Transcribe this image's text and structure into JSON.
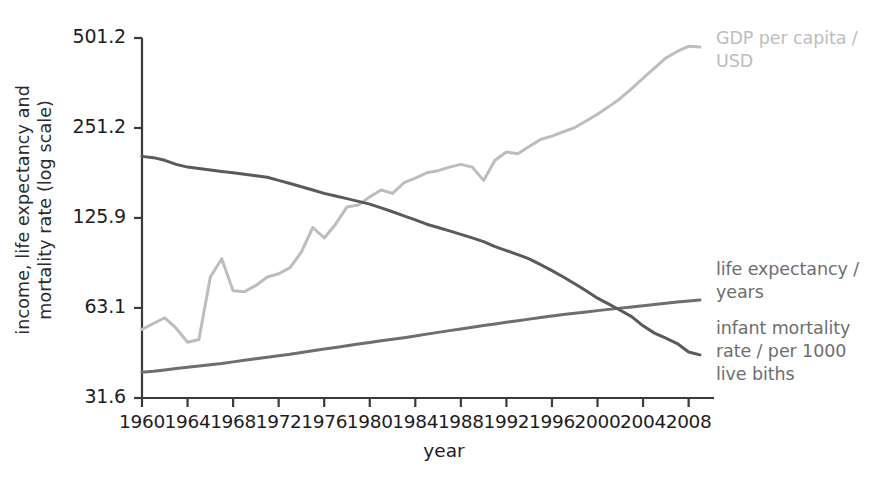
{
  "chart_data": {
    "type": "line",
    "title": "",
    "xlabel": "year",
    "ylabel": "income, life expectancy and mortality rate (log scale)",
    "ylabel_line1": "income, life expectancy and",
    "ylabel_line2": "mortality rate (log scale)",
    "y_scale": "log",
    "ytick_labels": [
      "501.2",
      "251.2",
      "125.9",
      "63.1",
      "31.6"
    ],
    "ytick_values": [
      501.2,
      251.2,
      125.9,
      63.1,
      31.6
    ],
    "ylim": [
      31.6,
      501.2
    ],
    "xtick_labels": [
      "1960",
      "1964",
      "1968",
      "1972",
      "1976",
      "1980",
      "1984",
      "1988",
      "1992",
      "1996",
      "2000",
      "2004",
      "2008"
    ],
    "xtick_values": [
      1960,
      1964,
      1968,
      1972,
      1976,
      1980,
      1984,
      1988,
      1992,
      1996,
      2000,
      2004,
      2008
    ],
    "xlim": [
      1960,
      2009
    ],
    "grid": false,
    "legend_position": "right-inline",
    "colors": {
      "gdp": "#bdbdbd",
      "life_expectancy": "#6e6e6e",
      "infant_mortality": "#5a5a5a",
      "axis": "#3a3a3a",
      "background": "#ffffff"
    },
    "x": [
      1960,
      1961,
      1962,
      1963,
      1964,
      1965,
      1966,
      1967,
      1968,
      1969,
      1970,
      1971,
      1972,
      1973,
      1974,
      1975,
      1976,
      1977,
      1978,
      1979,
      1980,
      1981,
      1982,
      1983,
      1984,
      1985,
      1986,
      1987,
      1988,
      1989,
      1990,
      1991,
      1992,
      1993,
      1994,
      1995,
      1996,
      1997,
      1998,
      1999,
      2000,
      2001,
      2002,
      2003,
      2004,
      2005,
      2006,
      2007,
      2008,
      2009
    ],
    "series": [
      {
        "name": "GDP per capita / USD",
        "label_line1": "GDP per capita /",
        "label_line2": "USD",
        "color": "#bdbdbd",
        "units": "USD",
        "values": [
          53.5,
          56.0,
          58.5,
          54.0,
          48.5,
          49.5,
          80.0,
          92.0,
          72.0,
          71.5,
          75.0,
          80.0,
          82.0,
          86.0,
          97.0,
          117.0,
          108.0,
          120.0,
          137.0,
          139.0,
          148.0,
          156.0,
          152.0,
          165.0,
          171.0,
          178.0,
          181.0,
          186.0,
          190.0,
          186.0,
          168.0,
          196.0,
          209.0,
          206.0,
          218.0,
          230.0,
          236.0,
          244.0,
          252.0,
          265.0,
          279.0,
          296.0,
          315.0,
          340.0,
          368.0,
          398.0,
          430.0,
          452.0,
          470.0,
          468.0
        ]
      },
      {
        "name": "life expectancy / years",
        "label_line1": "life expectancy /",
        "label_line2": "years",
        "color": "#6e6e6e",
        "units": "years",
        "values": [
          38.5,
          38.8,
          39.2,
          39.6,
          40.0,
          40.4,
          40.8,
          41.2,
          41.7,
          42.2,
          42.7,
          43.2,
          43.7,
          44.2,
          44.8,
          45.4,
          46.0,
          46.6,
          47.2,
          47.8,
          48.4,
          49.0,
          49.6,
          50.2,
          50.9,
          51.6,
          52.3,
          53.0,
          53.7,
          54.4,
          55.1,
          55.8,
          56.5,
          57.2,
          57.9,
          58.6,
          59.3,
          60.0,
          60.6,
          61.2,
          61.8,
          62.4,
          63.0,
          63.6,
          64.2,
          64.8,
          65.4,
          66.0,
          66.6,
          67.0
        ]
      },
      {
        "name": "infant mortality rate / per 1000 live biths",
        "label_line1": "infant mortality",
        "label_line2": "rate / per 1000",
        "label_line3": "live biths",
        "color": "#5a5a5a",
        "units": "per 1000 live births",
        "values": [
          202.0,
          200.0,
          196.0,
          190.0,
          186.0,
          184.0,
          182.0,
          180.0,
          178.0,
          176.0,
          174.0,
          172.0,
          168.0,
          164.0,
          160.0,
          156.0,
          152.0,
          149.0,
          146.0,
          143.0,
          140.0,
          136.0,
          132.0,
          128.0,
          124.0,
          120.0,
          117.0,
          114.0,
          111.0,
          108.0,
          105.0,
          101.0,
          98.0,
          95.0,
          92.0,
          88.0,
          84.0,
          80.0,
          76.0,
          72.0,
          68.0,
          65.0,
          62.0,
          59.0,
          55.0,
          52.0,
          50.0,
          48.0,
          45.0,
          44.0
        ]
      }
    ]
  },
  "axis_title": {
    "x": "year"
  }
}
